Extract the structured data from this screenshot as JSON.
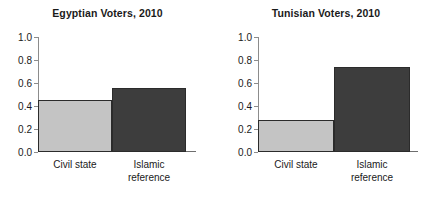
{
  "chart_data": [
    {
      "type": "bar",
      "title": "Egyptian Voters, 2010",
      "categories": [
        "Civil state",
        "Islamic reference"
      ],
      "values": [
        0.45,
        0.56
      ],
      "xlabel": "",
      "ylabel": "",
      "ylim": [
        0.0,
        1.0
      ],
      "yticks": [
        "0.0",
        "0.2",
        "0.4",
        "0.6",
        "0.8",
        "1.0"
      ],
      "ytick_values": [
        0.0,
        0.2,
        0.4,
        0.6,
        0.8,
        1.0
      ],
      "grid": false,
      "legend": "none",
      "bar_colors": [
        "#c4c4c4",
        "#3d3d3d"
      ],
      "bar_edge_color": "#2b2b2b"
    },
    {
      "type": "bar",
      "title": "Tunisian Voters, 2010",
      "categories": [
        "Civil state",
        "Islamic reference"
      ],
      "values": [
        0.28,
        0.735
      ],
      "xlabel": "",
      "ylabel": "",
      "ylim": [
        0.0,
        1.0
      ],
      "yticks": [
        "0.0",
        "0.2",
        "0.4",
        "0.6",
        "0.8",
        "1.0"
      ],
      "ytick_values": [
        0.0,
        0.2,
        0.4,
        0.6,
        0.8,
        1.0
      ],
      "grid": false,
      "legend": "none",
      "bar_colors": [
        "#c4c4c4",
        "#3d3d3d"
      ],
      "bar_edge_color": "#2b2b2b"
    }
  ],
  "panels": [
    {
      "title": "Egyptian Voters, 2010",
      "ticks": [
        {
          "label": "1.0",
          "value": 1.0
        },
        {
          "label": "0.8",
          "value": 0.8
        },
        {
          "label": "0.6",
          "value": 0.6
        },
        {
          "label": "0.4",
          "value": 0.4
        },
        {
          "label": "0.2",
          "value": 0.2
        },
        {
          "label": "0.0",
          "value": 0.0
        }
      ],
      "bars": [
        {
          "label": "Civil state",
          "label_line1": "Civil state",
          "label_line2": "",
          "value": 0.45,
          "color": "#c4c4c4"
        },
        {
          "label": "Islamic reference",
          "label_line1": "Islamic",
          "label_line2": "reference",
          "value": 0.56,
          "color": "#3d3d3d"
        }
      ]
    },
    {
      "title": "Tunisian Voters, 2010",
      "ticks": [
        {
          "label": "1.0",
          "value": 1.0
        },
        {
          "label": "0.8",
          "value": 0.8
        },
        {
          "label": "0.6",
          "value": 0.6
        },
        {
          "label": "0.4",
          "value": 0.4
        },
        {
          "label": "0.2",
          "value": 0.2
        },
        {
          "label": "0.0",
          "value": 0.0
        }
      ],
      "bars": [
        {
          "label": "Civil state",
          "label_line1": "Civil state",
          "label_line2": "",
          "value": 0.28,
          "color": "#c4c4c4"
        },
        {
          "label": "Islamic reference",
          "label_line1": "Islamic",
          "label_line2": "reference",
          "value": 0.735,
          "color": "#3d3d3d"
        }
      ]
    }
  ]
}
